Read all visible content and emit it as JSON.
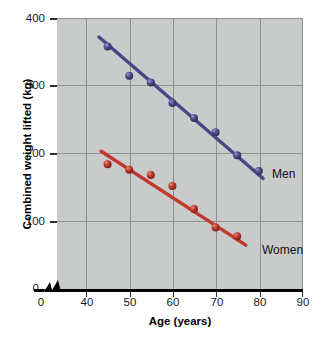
{
  "chart_data": {
    "type": "scatter",
    "title": "",
    "xlabel": "Age (years)",
    "ylabel": "Combined weight lifted (kg)",
    "xlim": [
      40,
      90
    ],
    "ylim": [
      0,
      400
    ],
    "xticks": [
      0,
      40,
      50,
      60,
      70,
      80,
      90
    ],
    "yticks": [
      0,
      100,
      200,
      300,
      400
    ],
    "grid": true,
    "axis_break_x": true,
    "legend_position": "inline-right",
    "series": [
      {
        "name": "Men",
        "color": "#4b4585",
        "x": [
          45,
          50,
          55,
          60,
          65,
          70,
          75,
          80
        ],
        "values": [
          358,
          315,
          305,
          275,
          253,
          232,
          198,
          175
        ],
        "trendline": {
          "x0": 43,
          "y0": 372,
          "x1": 81,
          "y1": 164
        }
      },
      {
        "name": "Women",
        "color": "#c1392c",
        "x": [
          45,
          50,
          55,
          60,
          65,
          70,
          75
        ],
        "values": [
          185,
          177,
          169,
          153,
          119,
          92,
          79
        ],
        "trendline": {
          "x0": 43.5,
          "y0": 204,
          "x1": 77,
          "y1": 66
        }
      }
    ]
  },
  "axes": {
    "y_title": "Combined weight lifted (kg)",
    "x_title": "Age (years)",
    "y_tick_labels": [
      "400",
      "300",
      "200",
      "100",
      "0"
    ],
    "x_tick_labels": [
      "0",
      "40",
      "50",
      "60",
      "70",
      "80",
      "90"
    ]
  },
  "labels": {
    "men": "Men",
    "women": "Women"
  },
  "colors": {
    "plot_background": "#c9cbcb",
    "gridline": "#8d9091",
    "men_series": "#4b4585",
    "women_series": "#c1392c",
    "axis": "#000000"
  }
}
